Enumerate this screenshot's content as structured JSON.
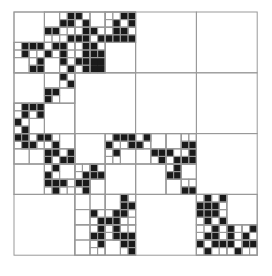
{
  "diagram": {
    "type": "quadtree-decomposition",
    "grid_size": 32,
    "origin": [
      14,
      12
    ],
    "cell_px": 7.6,
    "line_color": "#999999",
    "fill_color": "#1a1a1a",
    "black_cells": [
      [
        0,
        7
      ],
      [
        0,
        8
      ],
      [
        0,
        14
      ],
      [
        0,
        15
      ],
      [
        1,
        6
      ],
      [
        1,
        7
      ],
      [
        1,
        9
      ],
      [
        1,
        13
      ],
      [
        1,
        15
      ],
      [
        2,
        4
      ],
      [
        2,
        5
      ],
      [
        2,
        9
      ],
      [
        2,
        10
      ],
      [
        2,
        13
      ],
      [
        2,
        14
      ],
      [
        3,
        7
      ],
      [
        3,
        8
      ],
      [
        3,
        9
      ],
      [
        3,
        11
      ],
      [
        3,
        12
      ],
      [
        3,
        13
      ],
      [
        3,
        14
      ],
      [
        3,
        15
      ],
      [
        4,
        1
      ],
      [
        4,
        2
      ],
      [
        4,
        3
      ],
      [
        4,
        5
      ],
      [
        4,
        6
      ],
      [
        4,
        9
      ],
      [
        4,
        10
      ],
      [
        5,
        1
      ],
      [
        5,
        4
      ],
      [
        5,
        6
      ],
      [
        5,
        9
      ],
      [
        5,
        10
      ],
      [
        5,
        11
      ],
      [
        6,
        3
      ],
      [
        6,
        6
      ],
      [
        6,
        8
      ],
      [
        6,
        9
      ],
      [
        6,
        10
      ],
      [
        6,
        11
      ],
      [
        7,
        2
      ],
      [
        7,
        3
      ],
      [
        7,
        7
      ],
      [
        7,
        9
      ],
      [
        7,
        10
      ],
      [
        7,
        11
      ],
      [
        8,
        6
      ],
      [
        9,
        7
      ],
      [
        10,
        4
      ],
      [
        10,
        5
      ],
      [
        11,
        4
      ],
      [
        12,
        1
      ],
      [
        12,
        2
      ],
      [
        12,
        3
      ],
      [
        13,
        1
      ],
      [
        13,
        3
      ],
      [
        14,
        0
      ],
      [
        15,
        1
      ],
      [
        16,
        0
      ],
      [
        16,
        1
      ],
      [
        16,
        3
      ],
      [
        16,
        4
      ],
      [
        16,
        13
      ],
      [
        16,
        14
      ],
      [
        16,
        15
      ],
      [
        16,
        17
      ],
      [
        17,
        1
      ],
      [
        17,
        2
      ],
      [
        17,
        5
      ],
      [
        17,
        12
      ],
      [
        17,
        15
      ],
      [
        17,
        16
      ],
      [
        17,
        22
      ],
      [
        17,
        23
      ],
      [
        18,
        4
      ],
      [
        18,
        5
      ],
      [
        18,
        7
      ],
      [
        18,
        13
      ],
      [
        18,
        18
      ],
      [
        18,
        19
      ],
      [
        18,
        20
      ],
      [
        18,
        23
      ],
      [
        19,
        4
      ],
      [
        19,
        6
      ],
      [
        19,
        7
      ],
      [
        19,
        19
      ],
      [
        19,
        21
      ],
      [
        19,
        22
      ],
      [
        19,
        23
      ],
      [
        20,
        5
      ],
      [
        20,
        10
      ],
      [
        20,
        21
      ],
      [
        21,
        4
      ],
      [
        21,
        9
      ],
      [
        21,
        10
      ],
      [
        21,
        11
      ],
      [
        21,
        20
      ],
      [
        21,
        21
      ],
      [
        22,
        4
      ],
      [
        22,
        5
      ],
      [
        22,
        6
      ],
      [
        22,
        8
      ],
      [
        22,
        9
      ],
      [
        23,
        5
      ],
      [
        23,
        9
      ],
      [
        23,
        22
      ],
      [
        23,
        23
      ],
      [
        24,
        14
      ],
      [
        24,
        25
      ],
      [
        24,
        27
      ],
      [
        25,
        14
      ],
      [
        25,
        15
      ],
      [
        25,
        24
      ],
      [
        25,
        25
      ],
      [
        25,
        26
      ],
      [
        26,
        10
      ],
      [
        26,
        13
      ],
      [
        26,
        14
      ],
      [
        26,
        24
      ],
      [
        26,
        25
      ],
      [
        26,
        26
      ],
      [
        27,
        11
      ],
      [
        27,
        12
      ],
      [
        27,
        13
      ],
      [
        27,
        25
      ],
      [
        27,
        27
      ],
      [
        28,
        11
      ],
      [
        28,
        13
      ],
      [
        28,
        26
      ],
      [
        28,
        28
      ],
      [
        28,
        31
      ],
      [
        29,
        10
      ],
      [
        29,
        11
      ],
      [
        29,
        13
      ],
      [
        29,
        14
      ],
      [
        29,
        15
      ],
      [
        29,
        25
      ],
      [
        29,
        26
      ],
      [
        29,
        28
      ],
      [
        29,
        30
      ],
      [
        30,
        11
      ],
      [
        30,
        14
      ],
      [
        30,
        15
      ],
      [
        30,
        24
      ],
      [
        30,
        26
      ],
      [
        30,
        27
      ],
      [
        30,
        28
      ],
      [
        30,
        30
      ],
      [
        30,
        31
      ],
      [
        31,
        15
      ],
      [
        31,
        25
      ],
      [
        31,
        29
      ]
    ],
    "subdivided_blocks_8": [
      [
        0,
        2
      ],
      [
        0,
        3
      ],
      [
        1,
        2
      ],
      [
        2,
        0
      ],
      [
        2,
        1
      ],
      [
        2,
        2
      ],
      [
        2,
        3
      ],
      [
        3,
        1
      ],
      [
        3,
        3
      ]
    ]
  }
}
